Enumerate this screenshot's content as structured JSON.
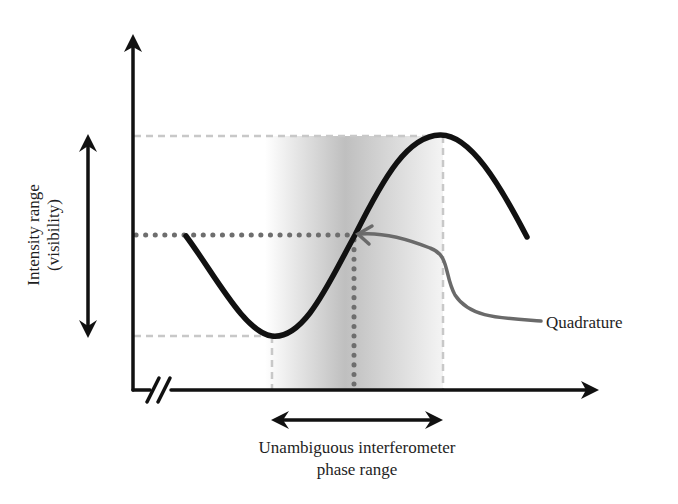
{
  "diagram": {
    "title": "",
    "y_axis_label_line1": "Intensity range",
    "y_axis_label_line2": "(visibility)",
    "x_axis_label_line1": "Unambiguous interferometer",
    "x_axis_label_line2": "phase range",
    "annotation": "Quadrature",
    "colors": {
      "curve": "#111111",
      "axes": "#111111",
      "dashed_guides": "#c8c8c8",
      "dotted_guides": "#6e6e6e",
      "annotation_arrow": "#6a6a6a",
      "shading": "#bdbdbd"
    },
    "elements": [
      "y-axis-arrow",
      "x-axis-arrow-with-break",
      "sine-curve",
      "shaded-phase-region",
      "intensity-range-double-arrow",
      "phase-range-double-arrow",
      "quadrature-point-pointer"
    ]
  }
}
